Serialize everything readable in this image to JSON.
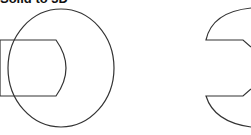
{
  "title": "Solid to 3D",
  "diagram": {
    "stroke_color": "#333333",
    "left_figure": {
      "description": "rectangle with convex right edge overlapped by a large ellipse",
      "shapes": [
        "rounded-rect",
        "ellipse"
      ]
    },
    "right_figure": {
      "description": "circle with rectangular notch removed (subtraction result)",
      "shapes": [
        "notched-circle"
      ]
    }
  }
}
